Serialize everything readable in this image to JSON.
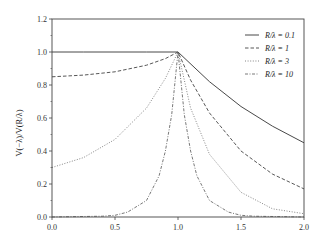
{
  "chart_data": {
    "type": "line",
    "title": "",
    "xlabel": "",
    "ylabel": "V(−λ)/V(R/λ)",
    "xlim": [
      0.0,
      2.0
    ],
    "ylim": [
      0.0,
      1.2
    ],
    "xticks": [
      "0.0",
      "0.5",
      "1.0",
      "1.5",
      "2.0"
    ],
    "yticks": [
      "0.0",
      "0.2",
      "0.4",
      "0.6",
      "0.8",
      "1.0",
      "1.2"
    ],
    "grid": false,
    "legend_position": "upper right",
    "series": [
      {
        "name": "R/λ = 0.1",
        "style": "solid",
        "x": [
          0.0,
          0.25,
          0.5,
          0.75,
          1.0,
          1.25,
          1.5,
          1.75,
          2.0
        ],
        "values": [
          1.0,
          1.0,
          1.0,
          1.0,
          1.0,
          0.82,
          0.67,
          0.55,
          0.45
        ]
      },
      {
        "name": "R/λ = 1",
        "style": "dashed",
        "x": [
          0.0,
          0.25,
          0.5,
          0.75,
          0.9,
          1.0,
          1.1,
          1.25,
          1.5,
          1.75,
          2.0
        ],
        "values": [
          0.85,
          0.86,
          0.88,
          0.92,
          0.96,
          1.0,
          0.83,
          0.63,
          0.4,
          0.26,
          0.17
        ]
      },
      {
        "name": "R/λ = 3",
        "style": "dotted",
        "x": [
          0.0,
          0.25,
          0.5,
          0.75,
          0.9,
          1.0,
          1.1,
          1.25,
          1.5,
          1.75,
          2.0
        ],
        "values": [
          0.3,
          0.36,
          0.47,
          0.66,
          0.84,
          1.0,
          0.66,
          0.38,
          0.15,
          0.05,
          0.02
        ]
      },
      {
        "name": "R/λ = 10",
        "style": "dash-dot",
        "x": [
          0.0,
          0.4,
          0.5,
          0.6,
          0.75,
          0.85,
          0.9,
          0.95,
          1.0,
          1.05,
          1.1,
          1.15,
          1.25,
          1.4,
          1.5,
          1.6,
          2.0
        ],
        "values": [
          0.0,
          0.005,
          0.01,
          0.03,
          0.1,
          0.25,
          0.4,
          0.62,
          1.0,
          0.62,
          0.4,
          0.25,
          0.1,
          0.03,
          0.01,
          0.005,
          0.0
        ]
      }
    ]
  },
  "legend": {
    "items": [
      {
        "label": "R/λ = 0.1"
      },
      {
        "label": "R/λ = 1"
      },
      {
        "label": "R/λ = 3"
      },
      {
        "label": "R/λ = 10"
      }
    ]
  },
  "axes": {
    "ylabel": "V(−λ)/V(R/λ)"
  }
}
